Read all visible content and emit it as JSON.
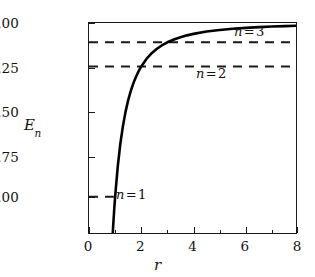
{
  "chart_data": {
    "type": "line",
    "title": "",
    "xlabel": "r",
    "ylabel": "E_n",
    "xlim": [
      0,
      8
    ],
    "ylim": [
      -1.22,
      0.0
    ],
    "grid": false,
    "legend": "inline-annotations",
    "x_ticks": [
      {
        "value": 0,
        "label": "0"
      },
      {
        "value": 2,
        "label": "2"
      },
      {
        "value": 4,
        "label": "4"
      },
      {
        "value": 6,
        "label": "6"
      },
      {
        "value": 8,
        "label": "8"
      }
    ],
    "x_minor_ticks": [
      1,
      3,
      5,
      7
    ],
    "y_ticks": [
      {
        "value": 0.0,
        "label": "0.00"
      },
      {
        "value": -0.25,
        "label": "−0.25"
      },
      {
        "value": -0.5,
        "label": "−0.50"
      },
      {
        "value": -0.75,
        "label": "−0.75"
      },
      {
        "value": -1.0,
        "label": "−1.00"
      }
    ],
    "series": [
      {
        "name": "E(r) = -1/r^2",
        "style": "solid",
        "color": "#000000",
        "x": [
          0.88,
          0.92,
          0.96,
          1.0,
          1.1,
          1.2,
          1.3,
          1.4,
          1.5,
          1.6,
          1.7,
          1.8,
          1.9,
          2.0,
          2.2,
          2.4,
          2.6,
          2.8,
          3.0,
          3.25,
          3.5,
          3.75,
          4.0,
          4.5,
          5.0,
          5.5,
          6.0,
          6.5,
          7.0,
          7.5,
          8.0
        ],
        "y": [
          -1.291,
          -1.181,
          -1.085,
          -1.0,
          -0.826,
          -0.694,
          -0.592,
          -0.51,
          -0.444,
          -0.391,
          -0.346,
          -0.309,
          -0.277,
          -0.25,
          -0.207,
          -0.174,
          -0.148,
          -0.128,
          -0.111,
          -0.0947,
          -0.0816,
          -0.0711,
          -0.0625,
          -0.0494,
          -0.04,
          -0.0331,
          -0.0278,
          -0.0237,
          -0.0204,
          -0.0178,
          -0.0156
        ]
      }
    ],
    "reference_lines": [
      {
        "name": "n=3",
        "label": "n = 3",
        "value": -0.111,
        "style": "dashed",
        "x_start": 0,
        "x_end": 8
      },
      {
        "name": "n=2",
        "label": "n = 2",
        "value": -0.25,
        "style": "dashed",
        "x_start": 0,
        "x_end": 8
      },
      {
        "name": "n=1",
        "label": "n = 1",
        "value": -1.0,
        "style": "dashed",
        "x_start": 0,
        "x_end": 0.95
      }
    ],
    "annotations": [
      {
        "name": "n3",
        "letter": "n",
        "eq": "=",
        "num": "3"
      },
      {
        "name": "n2",
        "letter": "n",
        "eq": "=",
        "num": "2"
      },
      {
        "name": "n1",
        "letter": "n",
        "eq": "=",
        "num": "1"
      }
    ]
  },
  "axes": {
    "y_title_letter": "E",
    "y_title_sub": "n",
    "x_title": "r"
  },
  "colors": {
    "axis": "#1a1a1a",
    "curve": "#000000",
    "dashed": "#1a1a1a",
    "text": "#121212",
    "background": "#ffffff"
  }
}
